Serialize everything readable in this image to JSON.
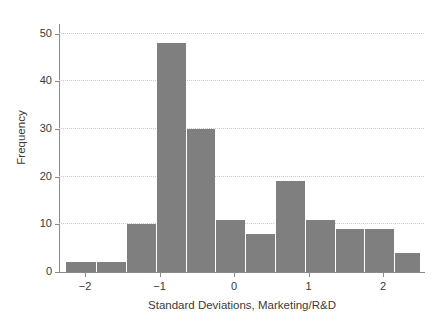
{
  "chart_data": {
    "type": "bar",
    "title": "",
    "subtitle": "",
    "xlabel": "Standard Deviations, Marketing/R&D",
    "ylabel": "Frequency",
    "xlim": [
      -2.35,
      2.55
    ],
    "ylim": [
      0,
      52
    ],
    "grid": "horizontal-dotted",
    "legend": "none",
    "bar_color": "#7f7f7f",
    "bar_edge_color": "#ffffff",
    "bin_width": 0.4,
    "x_ticks": [
      {
        "value": -2,
        "label": "−2"
      },
      {
        "value": -1,
        "label": "−1"
      },
      {
        "value": 0,
        "label": "0"
      },
      {
        "value": 1,
        "label": "1"
      },
      {
        "value": 2,
        "label": "2"
      }
    ],
    "y_ticks": [
      {
        "value": 0,
        "label": "0"
      },
      {
        "value": 10,
        "label": "10"
      },
      {
        "value": 20,
        "label": "20"
      },
      {
        "value": 30,
        "label": "30"
      },
      {
        "value": 40,
        "label": "40"
      },
      {
        "value": 50,
        "label": "50"
      }
    ],
    "bins": [
      {
        "x0": -2.25,
        "x1": -1.85,
        "center": -2.05,
        "value": 2
      },
      {
        "x0": -1.85,
        "x1": -1.45,
        "center": -1.65,
        "value": 2
      },
      {
        "x0": -1.45,
        "x1": -1.05,
        "center": -1.25,
        "value": 10
      },
      {
        "x0": -1.05,
        "x1": -0.65,
        "center": -0.85,
        "value": 48
      },
      {
        "x0": -0.65,
        "x1": -0.25,
        "center": -0.45,
        "value": 30
      },
      {
        "x0": -0.25,
        "x1": 0.15,
        "center": -0.05,
        "value": 11
      },
      {
        "x0": 0.15,
        "x1": 0.55,
        "center": 0.35,
        "value": 8
      },
      {
        "x0": 0.55,
        "x1": 0.95,
        "center": 0.75,
        "value": 19
      },
      {
        "x0": 0.95,
        "x1": 1.35,
        "center": 1.15,
        "value": 11
      },
      {
        "x0": 1.35,
        "x1": 1.75,
        "center": 1.55,
        "value": 9
      },
      {
        "x0": 1.75,
        "x1": 2.15,
        "center": 1.95,
        "value": 9
      },
      {
        "x0": 2.15,
        "x1": 2.5,
        "center": 2.33,
        "value": 4
      }
    ],
    "categories": [
      "-2.05",
      "-1.65",
      "-1.25",
      "-0.85",
      "-0.45",
      "-0.05",
      "0.35",
      "0.75",
      "1.15",
      "1.55",
      "1.95",
      "2.33"
    ],
    "values": [
      2,
      2,
      10,
      48,
      30,
      11,
      8,
      19,
      11,
      9,
      9,
      4
    ]
  }
}
